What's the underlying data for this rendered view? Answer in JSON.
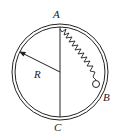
{
  "diagram": {
    "labels": {
      "top_point": "A",
      "bottom_point": "C",
      "right_point": "B",
      "radius": "R"
    },
    "colors": {
      "stroke": "#222222",
      "background": "#ffffff"
    }
  }
}
